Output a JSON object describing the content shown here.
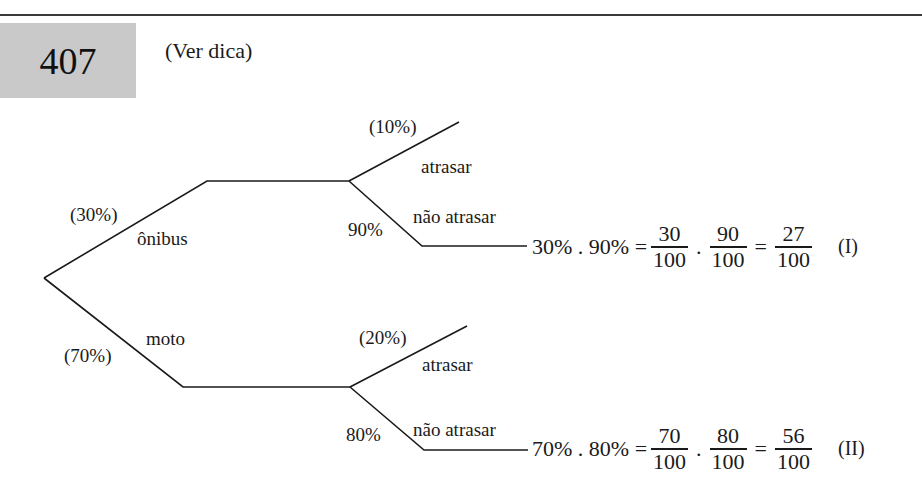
{
  "header": {
    "exercise_number": "407",
    "hint_label": "(Ver dica)"
  },
  "tree": {
    "root_branches": [
      {
        "name": "ônibus",
        "probability": "(30%)",
        "children": [
          {
            "name": "atrasar",
            "probability": "(10%)"
          },
          {
            "name": "não atrasar",
            "probability": "90%"
          }
        ]
      },
      {
        "name": "moto",
        "probability": "(70%)",
        "children": [
          {
            "name": "atrasar",
            "probability": "(20%)"
          },
          {
            "name": "não atrasar",
            "probability": "80%"
          }
        ]
      }
    ]
  },
  "equations": [
    {
      "lhs": "30% . 90% =",
      "frac1": {
        "num": "30",
        "den": "100"
      },
      "dot": ".",
      "frac2": {
        "num": "90",
        "den": "100"
      },
      "eq": "=",
      "result": {
        "num": "27",
        "den": "100"
      },
      "tag": "(I)"
    },
    {
      "lhs": "70% . 80% =",
      "frac1": {
        "num": "70",
        "den": "100"
      },
      "dot": ".",
      "frac2": {
        "num": "80",
        "den": "100"
      },
      "eq": "=",
      "result": {
        "num": "56",
        "den": "100"
      },
      "tag": "(II)"
    }
  ]
}
